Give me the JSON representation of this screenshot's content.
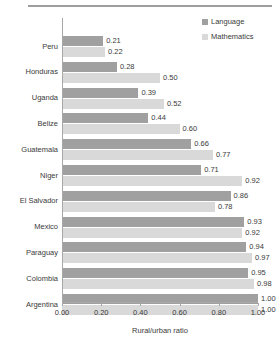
{
  "chart_data": {
    "type": "bar",
    "orientation": "horizontal",
    "title": "",
    "xlabel": "Rural/urban ratio",
    "ylabel": "",
    "xlim": [
      0.0,
      1.0
    ],
    "grid": false,
    "legend_position": "top-right",
    "categories": [
      "Peru",
      "Honduras",
      "Uganda",
      "Belize",
      "Guatemala",
      "Niger",
      "El Salvador",
      "Mexico",
      "Paraguay",
      "Colombia",
      "Argentina"
    ],
    "series": [
      {
        "name": "Language",
        "color": "#a0a0a0",
        "values": [
          0.21,
          0.28,
          0.39,
          0.44,
          0.66,
          0.71,
          0.86,
          0.93,
          0.94,
          0.95,
          1.0
        ],
        "labels": [
          "0.21",
          "0.28",
          "0.39",
          "0.44",
          "0.66",
          "0.71",
          "0.86",
          "0.93",
          "0.94",
          "0.95",
          "1.00"
        ]
      },
      {
        "name": "Mathematics",
        "color": "#d9d9d9",
        "values": [
          0.22,
          0.5,
          0.52,
          0.6,
          0.77,
          0.92,
          0.78,
          0.92,
          0.97,
          0.98,
          1.0
        ],
        "labels": [
          "0.22",
          "0.50",
          "0.52",
          "0.60",
          "0.77",
          "0.92",
          "0.78",
          "0.92",
          "0.97",
          "0.98",
          "1.00"
        ]
      }
    ],
    "xticks": [
      0.0,
      0.2,
      0.4,
      0.6,
      0.8,
      1.0
    ],
    "xticklabels": [
      "0.00",
      "0.20",
      "0.40",
      "0.60",
      "0.80",
      "1.00"
    ]
  },
  "legend": {
    "items": [
      {
        "label": "Language",
        "color": "#a0a0a0"
      },
      {
        "label": "Mathematics",
        "color": "#d9d9d9"
      }
    ]
  },
  "axis": {
    "xlabel": "Rural/urban ratio"
  }
}
